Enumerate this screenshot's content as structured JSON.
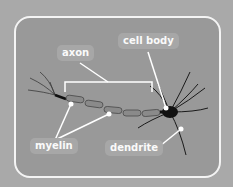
{
  "diagram": {
    "labels": [
      {
        "id": "axon",
        "text": "axon"
      },
      {
        "id": "cell-body",
        "text": "cell body"
      },
      {
        "id": "myelin",
        "text": "myelin"
      },
      {
        "id": "dendrite",
        "text": "dendrite"
      }
    ]
  },
  "colors": {
    "background": "#a9a9a9",
    "panel": "#999999",
    "frame": "#f4f4f4",
    "label_bg": "#a7a7a7",
    "label_text": "#fafafa"
  }
}
